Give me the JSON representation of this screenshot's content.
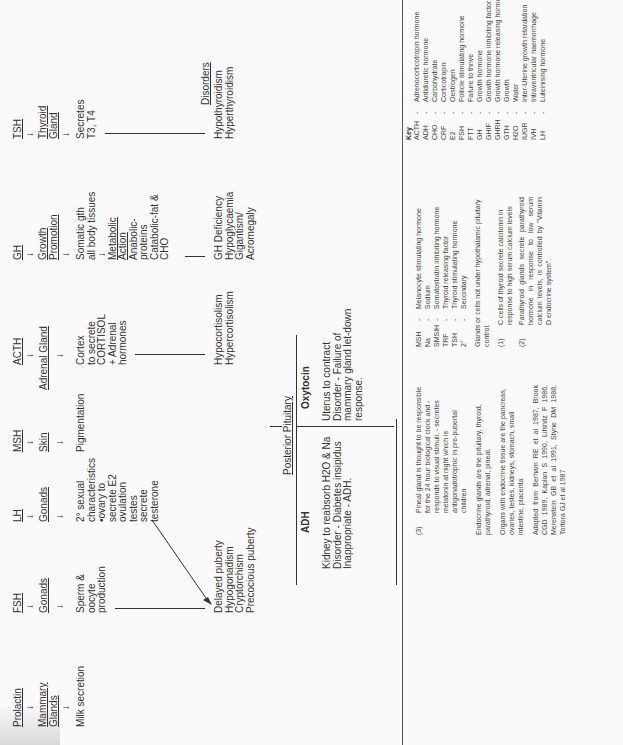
{
  "flow": {
    "hormones": [
      {
        "id": "tsh",
        "name": "TSH",
        "target": "Thyroid Gland",
        "effect": [
          "Secretes",
          "T3, T4"
        ],
        "disorders": [
          "Hypothyroidism",
          "Hyperthyroidism"
        ]
      },
      {
        "id": "gh",
        "name": "GH",
        "target": "Growth Promotion",
        "effect": [
          "Somatic gth",
          "all body tissues"
        ],
        "metabolic": "Metabolic Action",
        "metabolic_effect": [
          "Anabolic-",
          "proteins",
          "Catabolic-fat &",
          "CHO"
        ],
        "disorders": [
          "GH Deficiency",
          "Hypoglycaemia",
          "Gigantism/",
          "Acromegaly"
        ]
      },
      {
        "id": "acth",
        "name": "ACTH",
        "target": "Adrenal Gland",
        "effect": [
          "Cortex",
          "to secrete",
          "CORTISOL",
          "+ Adrenal",
          "hormones"
        ],
        "disorders": [
          "Hypocortisolism",
          "Hypercortisolism"
        ]
      },
      {
        "id": "msh",
        "name": "MSH",
        "target": "Skin",
        "effect": [
          "Pigmentation"
        ]
      },
      {
        "id": "lh",
        "name": "LH",
        "target": "Gonads",
        "effect": [
          "2° sexual",
          "characteristics",
          "•ovary to",
          "secrete E2",
          "ovulation",
          "testes",
          "secrete",
          "testerone"
        ]
      },
      {
        "id": "fsh",
        "name": "FSH",
        "target": "Gonads",
        "effect": [
          "Sperm &",
          "oocyte",
          "production"
        ],
        "disorders": [
          "Delayed puberty",
          "Hypogonadism",
          "Cryptorchism",
          "Precocious puberty"
        ]
      },
      {
        "id": "prl",
        "name": "Prolactin",
        "target": "Mammary Glands",
        "effect": [
          "Milk secretion"
        ]
      }
    ],
    "disorders_label": "Disorders",
    "arrow_glyph": "→"
  },
  "posterior": {
    "title": "Posterior Pituitary",
    "oxytocin": {
      "name": "Oxytocin",
      "lines": [
        "Uterus to contract",
        "Disorder - Failure of",
        "mammary gland let-down",
        "response."
      ],
      "disorder_word": "Disorder"
    },
    "adh": {
      "name": "ADH",
      "lines": [
        "Kidney to reabsorb H2O & Na",
        "Disorder - Diabetes insipidus",
        "Inappropriate - ADH."
      ]
    }
  },
  "key": {
    "title": "Key",
    "col1": [
      {
        "ab": "ACTH",
        "def": "Adrenocorticotropin hormone"
      },
      {
        "ab": "ADH",
        "def": "Antidiuretic hormone"
      },
      {
        "ab": "CHO",
        "def": "Carbohydrate"
      },
      {
        "ab": "CRF",
        "def": "Corticotropin"
      },
      {
        "ab": "E2",
        "def": "Oestrogen"
      },
      {
        "ab": "FSH",
        "def": "Follicle stimulating hormone"
      },
      {
        "ab": "FTT",
        "def": "Failure to thrive"
      },
      {
        "ab": "GH",
        "def": "Growth hormone"
      },
      {
        "ab": "GHIF",
        "def": "Growth hormone inhibiting factor"
      },
      {
        "ab": "GHRH",
        "def": "Growth hormone releasing hormone"
      },
      {
        "ab": "GTH",
        "def": "Growth"
      },
      {
        "ab": "H2O",
        "def": "Water"
      },
      {
        "ab": "IUGR",
        "def": "Inter-Uterine growth retardation"
      },
      {
        "ab": "IVH",
        "def": "Intraventricular haemorrhage"
      },
      {
        "ab": "LH",
        "def": "Luteinising hormone"
      }
    ],
    "col2": [
      {
        "ab": "MSH",
        "def": "Melanocyte stimulating hormone"
      },
      {
        "ab": "Na",
        "def": "Sodium"
      },
      {
        "ab": "SMSIH",
        "def": "Somatostratin inhibiting hormone"
      },
      {
        "ab": "TRF",
        "def": "Thyroid releasing factor"
      },
      {
        "ab": "TSH",
        "def": "Thyroid stimulating hormone"
      },
      {
        "ab": "2°",
        "def": "Secondary"
      }
    ],
    "dash": "-",
    "glands_note": "Glands or cells not under hypothalamic pituitary control.",
    "notes": [
      {
        "num": "(1)",
        "text": "C cells of thyroid secrete calcitonin in response to high serum calcium levels"
      },
      {
        "num": "(2)",
        "text": "Parathyroid glands secrete parathyroid hormone in response to low serum calcium levels, is controlled by \"Vitamin D endocrine system\"."
      },
      {
        "num": "(3)",
        "text": "Pineal gland is thought to be responsible for the 24 hour biological clock and - responds to visual stimuli. - secretes melatonin at night which is antigonadotrophic in pre-pubertal children"
      }
    ],
    "endocrine": "Endocrine glands are the pituitary, thyroid, parathyroid, adrenal, pineal.",
    "organs": "Organs with endocrine tissue are the pancreas, ovaries, testes, kidneys, stomach, small intestine, placenta",
    "adapted": "Adapted from Berham RE et al 1987, Brook CGD 1989, Kaplan S 1990, Lifshitz F 1986, Merenstein GB et al 1991, Styne DM 1988, Tortora GJ et al 1987"
  }
}
